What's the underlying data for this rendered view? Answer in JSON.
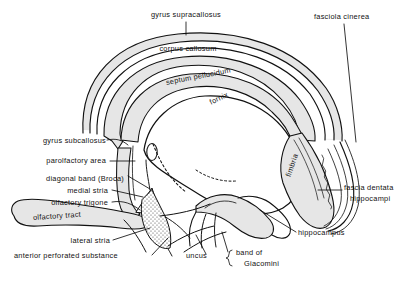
{
  "figure": {
    "type": "anatomical-line-diagram",
    "colors": {
      "background": "#ffffff",
      "outline": "#111111",
      "band_fill": "#e6e6e6",
      "cavity_fill": "#ffffff",
      "stipple": "#555555",
      "text": "#111111"
    }
  },
  "labels": {
    "gyrus_supracallosus": "gyrus supracallosus",
    "fasciola_cinerea": "fasciola cinerea",
    "corpus_callosum": "corpus callosum",
    "septum_pellucidum": "septum pellucidum",
    "fornix": "fornix",
    "fimbria": "fimbria",
    "gyrus_subcallosus": "gyrus subcallosus",
    "parolfactory_area": "parolfactory area",
    "diagonal_band_broca": "diagonal band (Broca)",
    "medial_stria": "medial stria",
    "olfactory_trigone": "olfactory trigone",
    "olfactory_tract": "olfactory tract",
    "lateral_stria": "lateral stria",
    "anterior_perforated_substance": "anterior perforated substance",
    "uncus": "uncus",
    "band_of_giacomini_line1": "band of",
    "band_of_giacomini_line2": "Giacomini",
    "fascia_dentata_line1": "fascia dentata",
    "fascia_dentata_line2": "hippocampi",
    "hippocampus": "hippocampus"
  }
}
